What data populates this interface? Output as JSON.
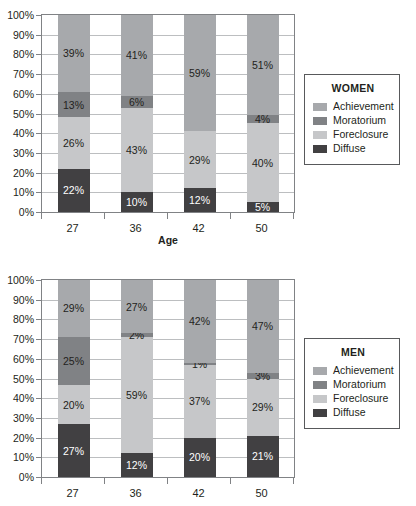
{
  "colors": {
    "achievement": "#a7a9ac",
    "moratorium": "#808285",
    "foreclosure": "#c6c7c9",
    "diffuse": "#414042",
    "grid": "#bcbec0",
    "frame": "#808285",
    "text": "#231f20"
  },
  "axis": {
    "y_ticks": [
      "100%",
      "90%",
      "80%",
      "70%",
      "60%",
      "50%",
      "40%",
      "30%",
      "20%",
      "10%",
      "0%"
    ],
    "x_title": "Age"
  },
  "chart_data": [
    {
      "type": "bar",
      "id": "women",
      "title": "WOMEN",
      "stacked": true,
      "percent": true,
      "xlabel": "Age",
      "ylabel": "",
      "ylim": [
        0,
        100
      ],
      "grid": true,
      "legend_position": "right",
      "categories": [
        "27",
        "36",
        "42",
        "50"
      ],
      "series": [
        {
          "name": "Diffuse",
          "color": "#414042",
          "values": [
            22,
            10,
            12,
            5
          ],
          "labels": [
            "22%",
            "10%",
            "12%",
            "5%"
          ]
        },
        {
          "name": "Foreclosure",
          "color": "#c6c7c9",
          "values": [
            26,
            43,
            29,
            40
          ],
          "labels": [
            "26%",
            "43%",
            "29%",
            "40%"
          ]
        },
        {
          "name": "Moratorium",
          "color": "#808285",
          "values": [
            13,
            6,
            0,
            4
          ],
          "labels": [
            "13%",
            "6%",
            "",
            "4%"
          ]
        },
        {
          "name": "Achievement",
          "color": "#a7a9ac",
          "values": [
            39,
            41,
            59,
            51
          ],
          "labels": [
            "39%",
            "41%",
            "59%",
            "51%"
          ]
        }
      ]
    },
    {
      "type": "bar",
      "id": "men",
      "title": "MEN",
      "stacked": true,
      "percent": true,
      "xlabel": "",
      "ylabel": "",
      "ylim": [
        0,
        100
      ],
      "grid": true,
      "legend_position": "right",
      "categories": [
        "27",
        "36",
        "42",
        "50"
      ],
      "series": [
        {
          "name": "Diffuse",
          "color": "#414042",
          "values": [
            27,
            12,
            20,
            21
          ],
          "labels": [
            "27%",
            "12%",
            "20%",
            "21%"
          ]
        },
        {
          "name": "Foreclosure",
          "color": "#c6c7c9",
          "values": [
            20,
            59,
            37,
            29
          ],
          "labels": [
            "20%",
            "59%",
            "37%",
            "29%"
          ]
        },
        {
          "name": "Moratorium",
          "color": "#808285",
          "values": [
            25,
            2,
            1,
            3
          ],
          "labels": [
            "25%",
            "2%",
            "1%",
            "3%"
          ]
        },
        {
          "name": "Achievement",
          "color": "#a7a9ac",
          "values": [
            29,
            27,
            42,
            47
          ],
          "labels": [
            "29%",
            "27%",
            "42%",
            "47%"
          ]
        }
      ]
    }
  ],
  "legends": [
    {
      "id": "women",
      "title": "WOMEN",
      "items": [
        {
          "label": "Achievement",
          "color": "#a7a9ac"
        },
        {
          "label": "Moratorium",
          "color": "#808285"
        },
        {
          "label": "Foreclosure",
          "color": "#c6c7c9"
        },
        {
          "label": "Diffuse",
          "color": "#414042"
        }
      ]
    },
    {
      "id": "men",
      "title": "MEN",
      "items": [
        {
          "label": "Achievement",
          "color": "#a7a9ac"
        },
        {
          "label": "Moratorium",
          "color": "#808285"
        },
        {
          "label": "Foreclosure",
          "color": "#c6c7c9"
        },
        {
          "label": "Diffuse",
          "color": "#414042"
        }
      ]
    }
  ]
}
